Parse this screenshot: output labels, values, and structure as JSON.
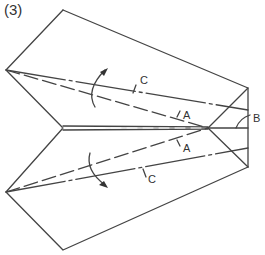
{
  "step": {
    "label": "(3)"
  },
  "labels": {
    "upper_c": "C",
    "upper_a": "A",
    "lower_a": "A",
    "lower_c": "C",
    "b": "B"
  },
  "colors": {
    "line": "#444444",
    "background": "#ffffff"
  },
  "diagram": {
    "type": "paper-airplane folding step",
    "outline_points": [
      [
        63,
        10
      ],
      [
        248,
        88
      ],
      [
        248,
        167
      ],
      [
        63,
        250
      ],
      [
        6,
        192
      ],
      [
        63,
        128
      ],
      [
        6,
        70
      ]
    ],
    "fold_center": [
      208,
      128
    ],
    "arrows": [
      "upper fold arrow (curved, pointing up-right)",
      "lower fold arrow (curved, pointing down-right)"
    ]
  }
}
